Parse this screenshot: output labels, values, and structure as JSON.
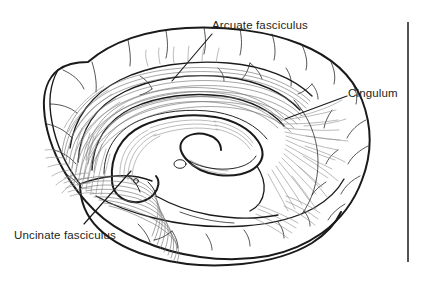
{
  "figure": {
    "kind": "anatomical-illustration",
    "background_color": "#ffffff",
    "ink_color": "#1a1a1a",
    "fiber_color": "#8d8d8d",
    "width": 421,
    "height": 284
  },
  "labels": {
    "arcuate": {
      "text": "Arcuate fasciculus",
      "leader_from_x": 212,
      "leader_from_y": 34,
      "leader_to_x": 172,
      "leader_to_y": 81
    },
    "cingulum": {
      "text": "Cingulum",
      "leader_from_x": 347,
      "leader_from_y": 96,
      "leader_to_x": 285,
      "leader_to_y": 119
    },
    "uncinate": {
      "text": "Uncinate fasciculus",
      "leader_from_x": 84,
      "leader_from_y": 224,
      "leader_to_x": 131,
      "leader_to_y": 171
    }
  },
  "rule": {
    "x": 408,
    "y_top": 22,
    "y_bottom": 262
  }
}
